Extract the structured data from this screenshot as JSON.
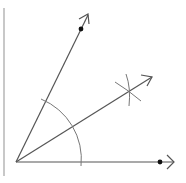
{
  "diagram": {
    "title": "",
    "type": "angle-bisector-construction",
    "colors": {
      "line": "#555555",
      "arc": "#777777",
      "point": "#111111",
      "frame": "#c8c8c8"
    },
    "vertex": [
      16,
      162
    ],
    "rays": [
      {
        "name": "upper-ray",
        "from": [
          16,
          162
        ],
        "to": [
          88,
          14
        ]
      },
      {
        "name": "bisector-ray",
        "from": [
          16,
          162
        ],
        "to": [
          152,
          76
        ]
      },
      {
        "name": "horizontal-ray",
        "from": [
          16,
          162
        ],
        "to": [
          173,
          162
        ]
      }
    ],
    "points": [
      {
        "name": "point-on-upper-ray",
        "at": [
          81,
          29
        ]
      },
      {
        "name": "point-on-horizontal-ray",
        "at": [
          160,
          162
        ]
      }
    ],
    "arc": {
      "center": [
        16,
        162
      ],
      "radius": 65
    },
    "intersection_mark": {
      "at": [
        129,
        91
      ]
    }
  }
}
